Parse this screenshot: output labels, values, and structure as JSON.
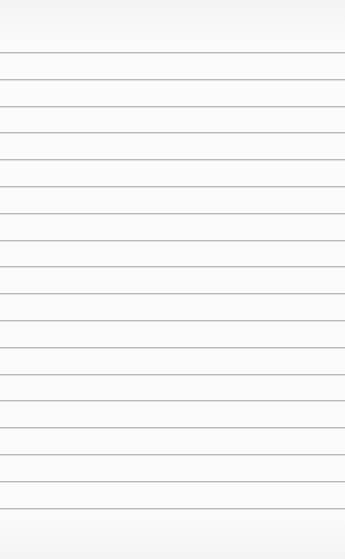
{
  "page": {
    "type": "lined-paper",
    "background_color": "#fbfbfb",
    "line_color": "#b9b9b9",
    "line_count": 18,
    "first_line_y": 52,
    "line_spacing": 26.8
  }
}
